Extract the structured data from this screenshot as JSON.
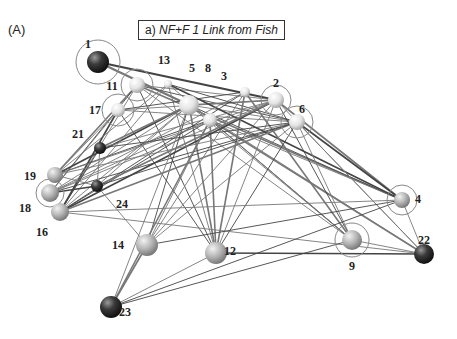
{
  "panel_label": "(A)",
  "title": {
    "prefix": "a)",
    "text": "NF+F 1 Link from Fish"
  },
  "nodes": [
    {
      "id": "1",
      "x": 98,
      "y": 62,
      "r": 11,
      "fill": "dark",
      "ring": 22,
      "lx": 88,
      "ly": 48
    },
    {
      "id": "2",
      "x": 276,
      "y": 100,
      "r": 8,
      "fill": "light",
      "ring": 15,
      "lx": 276,
      "ly": 87
    },
    {
      "id": "3",
      "x": 245,
      "y": 92,
      "r": 5,
      "fill": "light",
      "ring": 0,
      "lx": 224,
      "ly": 80
    },
    {
      "id": "4",
      "x": 402,
      "y": 200,
      "r": 8,
      "fill": "mid",
      "ring": 15,
      "lx": 418,
      "ly": 203
    },
    {
      "id": "5",
      "x": 189,
      "y": 105,
      "r": 10,
      "fill": "light",
      "ring": 0,
      "lx": 192,
      "ly": 72
    },
    {
      "id": "6",
      "x": 297,
      "y": 122,
      "r": 8,
      "fill": "light",
      "ring": 16,
      "lx": 302,
      "ly": 113
    },
    {
      "id": "8",
      "x": 210,
      "y": 120,
      "r": 7,
      "fill": "light",
      "ring": 0,
      "lx": 208,
      "ly": 72
    },
    {
      "id": "9",
      "x": 352,
      "y": 240,
      "r": 10,
      "fill": "mid",
      "ring": 17,
      "lx": 352,
      "ly": 270
    },
    {
      "id": "11",
      "x": 137,
      "y": 85,
      "r": 8,
      "fill": "light",
      "ring": 16,
      "lx": 112,
      "ly": 90
    },
    {
      "id": "12",
      "x": 216,
      "y": 253,
      "r": 11,
      "fill": "mid",
      "ring": 0,
      "lx": 230,
      "ly": 255
    },
    {
      "id": "13",
      "x": 168,
      "y": 84,
      "r": 4,
      "fill": "light",
      "ring": 0,
      "lx": 164,
      "ly": 64
    },
    {
      "id": "14",
      "x": 147,
      "y": 245,
      "r": 11,
      "fill": "mid",
      "ring": 0,
      "lx": 118,
      "ly": 249
    },
    {
      "id": "16",
      "x": 60,
      "y": 212,
      "r": 9,
      "fill": "mid",
      "ring": 0,
      "lx": 42,
      "ly": 236
    },
    {
      "id": "17",
      "x": 118,
      "y": 110,
      "r": 7,
      "fill": "light",
      "ring": 16,
      "lx": 95,
      "ly": 114
    },
    {
      "id": "18",
      "x": 50,
      "y": 193,
      "r": 9,
      "fill": "mid",
      "ring": 14,
      "lx": 25,
      "ly": 212
    },
    {
      "id": "19",
      "x": 55,
      "y": 175,
      "r": 8,
      "fill": "mid",
      "ring": 0,
      "lx": 30,
      "ly": 180
    },
    {
      "id": "21",
      "x": 100,
      "y": 148,
      "r": 6,
      "fill": "dark",
      "ring": 0,
      "lx": 78,
      "ly": 138
    },
    {
      "id": "22",
      "x": 424,
      "y": 254,
      "r": 10,
      "fill": "dark",
      "ring": 0,
      "lx": 424,
      "ly": 244
    },
    {
      "id": "23",
      "x": 111,
      "y": 307,
      "r": 11,
      "fill": "dark",
      "ring": 0,
      "lx": 125,
      "ly": 316
    },
    {
      "id": "24",
      "x": 97,
      "y": 186,
      "r": 6,
      "fill": "dark",
      "ring": 0,
      "lx": 122,
      "ly": 208
    }
  ],
  "edges": [
    [
      "1",
      "2"
    ],
    [
      "1",
      "5"
    ],
    [
      "11",
      "2"
    ],
    [
      "11",
      "6"
    ],
    [
      "11",
      "4"
    ],
    [
      "11",
      "9"
    ],
    [
      "11",
      "12"
    ],
    [
      "11",
      "16"
    ],
    [
      "11",
      "19"
    ],
    [
      "11",
      "18"
    ],
    [
      "17",
      "2"
    ],
    [
      "17",
      "6"
    ],
    [
      "17",
      "16"
    ],
    [
      "17",
      "19"
    ],
    [
      "17",
      "18"
    ],
    [
      "17",
      "12"
    ],
    [
      "5",
      "2"
    ],
    [
      "5",
      "6"
    ],
    [
      "5",
      "4"
    ],
    [
      "5",
      "9"
    ],
    [
      "5",
      "12"
    ],
    [
      "5",
      "14"
    ],
    [
      "5",
      "16"
    ],
    [
      "5",
      "18"
    ],
    [
      "5",
      "19"
    ],
    [
      "5",
      "22"
    ],
    [
      "8",
      "4"
    ],
    [
      "8",
      "9"
    ],
    [
      "8",
      "12"
    ],
    [
      "8",
      "14"
    ],
    [
      "8",
      "16"
    ],
    [
      "8",
      "18"
    ],
    [
      "8",
      "22"
    ],
    [
      "8",
      "19"
    ],
    [
      "13",
      "9"
    ],
    [
      "13",
      "12"
    ],
    [
      "13",
      "4"
    ],
    [
      "13",
      "16"
    ],
    [
      "13",
      "19"
    ],
    [
      "13",
      "6"
    ],
    [
      "3",
      "12"
    ],
    [
      "3",
      "14"
    ],
    [
      "3",
      "16"
    ],
    [
      "3",
      "18"
    ],
    [
      "3",
      "9"
    ],
    [
      "3",
      "17"
    ],
    [
      "2",
      "12"
    ],
    [
      "2",
      "14"
    ],
    [
      "2",
      "16"
    ],
    [
      "2",
      "18"
    ],
    [
      "2",
      "19"
    ],
    [
      "2",
      "9"
    ],
    [
      "2",
      "4"
    ],
    [
      "2",
      "22"
    ],
    [
      "6",
      "12"
    ],
    [
      "6",
      "14"
    ],
    [
      "6",
      "16"
    ],
    [
      "6",
      "18"
    ],
    [
      "6",
      "19"
    ],
    [
      "6",
      "9"
    ],
    [
      "6",
      "4"
    ],
    [
      "6",
      "22"
    ],
    [
      "21",
      "2"
    ],
    [
      "21",
      "6"
    ],
    [
      "21",
      "5"
    ],
    [
      "21",
      "24"
    ],
    [
      "21",
      "16"
    ],
    [
      "24",
      "5"
    ],
    [
      "24",
      "2"
    ],
    [
      "24",
      "6"
    ],
    [
      "24",
      "14"
    ],
    [
      "24",
      "19"
    ],
    [
      "24",
      "18"
    ],
    [
      "16",
      "4"
    ],
    [
      "16",
      "22"
    ],
    [
      "14",
      "4"
    ],
    [
      "23",
      "14"
    ],
    [
      "23",
      "12"
    ],
    [
      "23",
      "9"
    ],
    [
      "23",
      "5"
    ],
    [
      "23",
      "8"
    ],
    [
      "23",
      "4"
    ],
    [
      "4",
      "22"
    ],
    [
      "9",
      "22"
    ],
    [
      "12",
      "22"
    ]
  ]
}
